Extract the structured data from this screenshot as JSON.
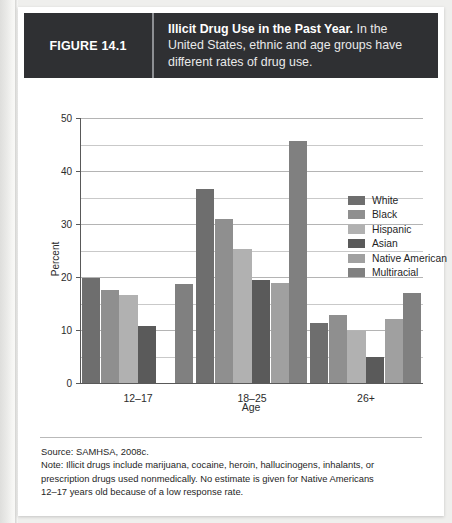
{
  "figure": {
    "label": "FIGURE 14.1",
    "title_strong": "Illicit Drug Use in the Past Year.",
    "title_rest": " In the United States, ethnic and age groups have different rates of drug use."
  },
  "notes": {
    "source": "Source: SAMHSA, 2008c.",
    "note_line1": "Note: Illicit drugs include marijuana, cocaine, heroin, hallucinogens, inhalants, or",
    "note_line2": "prescription drugs used nonmedically. No estimate is given for Native Americans",
    "note_line3": "12–17 years old because of a low response rate."
  },
  "chart_data": {
    "type": "bar",
    "title": "Illicit Drug Use in the Past Year",
    "xlabel": "Age",
    "ylabel": "Percent",
    "ylim": [
      0,
      50
    ],
    "yticks": [
      0,
      10,
      20,
      30,
      40,
      50
    ],
    "minor_gridlines": [
      5,
      15,
      25,
      35,
      45
    ],
    "grid": true,
    "legend_position": "upper right",
    "categories": [
      "12–17",
      "18–25",
      "26+"
    ],
    "series": [
      {
        "name": "White",
        "color": "#6e6e6e",
        "values": [
          19.9,
          36.6,
          11.3
        ]
      },
      {
        "name": "Black",
        "color": "#8f8f8f",
        "values": [
          17.5,
          31.0,
          12.8
        ]
      },
      {
        "name": "Hispanic",
        "color": "#b1b1b1",
        "values": [
          16.7,
          25.3,
          9.9
        ]
      },
      {
        "name": "Asian",
        "color": "#5a5a5a",
        "values": [
          10.8,
          19.4,
          5.0
        ]
      },
      {
        "name": "Native American",
        "color": "#a0a0a0",
        "values": [
          null,
          18.8,
          12.0
        ]
      },
      {
        "name": "Multiracial",
        "color": "#808080",
        "values": [
          18.7,
          45.6,
          16.9
        ]
      }
    ]
  },
  "colors": {
    "header_bg": "#2f3033",
    "axis": "#595959",
    "grid": "#c9c9c9"
  }
}
